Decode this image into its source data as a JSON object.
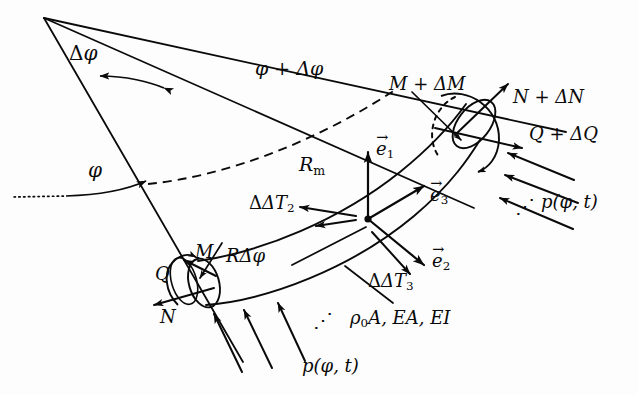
{
  "figure": {
    "background_color": "#fdfdfd",
    "ink_color": "#0a0a0a"
  },
  "labels": {
    "delta_phi": "Δφ",
    "phi_plus_delta_phi": "φ + Δφ",
    "phi": "φ",
    "R_m": "R",
    "R_m_sub": "m",
    "M_plus_delta_M": "M + ΔM",
    "N_plus_delta_N": "N + ΔN",
    "Q_plus_delta_Q": "Q + ΔQ",
    "M": "M",
    "Q": "Q",
    "N": "N",
    "e1": "e",
    "e1_sub": "1",
    "e2": "e",
    "e2_sub": "2",
    "e3": "e",
    "e3_sub": "3",
    "delta_T2": "ΔT",
    "delta_T2_sub": "2",
    "delta_T3": "ΔT",
    "delta_T3_sub": "3",
    "R_delta_phi": "RΔφ",
    "pressure_right": "p(φ, t)",
    "pressure_bottom": "p(φ, t)",
    "material_props_rho": "ρ",
    "material_props_rho_sub": "0",
    "material_props_rest": "A, EA, EI",
    "ellipsis_right": "⋰",
    "ellipsis_bottom": "⋰"
  },
  "geometry": {
    "apex": [
      44,
      18
    ],
    "ray_upper_end": [
      560,
      130
    ],
    "ray_lower_end": [
      240,
      360
    ],
    "ray_mid_end": [
      470,
      205
    ],
    "delta_phi_arc_label_pos": [
      78,
      48
    ],
    "phi_arc_label_pos": [
      93,
      166
    ]
  }
}
